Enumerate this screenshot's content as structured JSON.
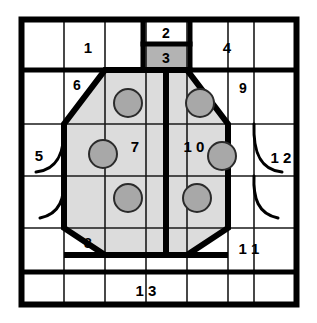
{
  "diagram": {
    "colors": {
      "line": "#000000",
      "background": "#ffffff",
      "octagon_fill": "#d9d9d9",
      "shaded_cell_fill": "#b3b3b3",
      "circle_fill": "#a6a6a6",
      "circle_stroke": "#333333",
      "thin_line": "#1a1a1a"
    },
    "geometry": {
      "outer_border": {
        "x": 20,
        "y": 18,
        "width": 278,
        "height": 288,
        "stroke_width": 6
      },
      "columns_x": [
        20,
        64,
        105,
        146,
        187,
        228,
        258,
        298
      ],
      "rows_y": [
        18,
        70,
        124,
        176,
        228,
        272,
        306
      ],
      "center_divider_x": 166,
      "octagon_points": "105,70 187,70 228,124 228,228 187,255 105,255 64,228 64,124",
      "thick_stroke": 6,
      "thin_stroke": 1.6
    },
    "circles": [
      {
        "name": "circle-top-left",
        "cx": 128,
        "cy": 103,
        "r": 14
      },
      {
        "name": "circle-top-right",
        "cx": 200,
        "cy": 103,
        "r": 14
      },
      {
        "name": "circle-mid-left",
        "cx": 103,
        "cy": 154,
        "r": 14
      },
      {
        "name": "circle-mid-right",
        "cx": 222,
        "cy": 156,
        "r": 14
      },
      {
        "name": "circle-bottom-left",
        "cx": 128,
        "cy": 198,
        "r": 14
      },
      {
        "name": "circle-bottom-right",
        "cx": 197,
        "cy": 198,
        "r": 14
      }
    ],
    "arcs": [
      {
        "name": "arc-left-upper",
        "d": "M 38 170 C 60 168 66 150 64 124",
        "side": "left"
      },
      {
        "name": "arc-left-lower",
        "d": "M 44 215 C 62 212 66 196 64 176",
        "side": "left"
      },
      {
        "name": "arc-right-upper",
        "d": "M 280 170 C 258 168 252 150 254 124",
        "side": "right"
      },
      {
        "name": "arc-right-lower",
        "d": "M 274 215 C 256 212 252 196 254 176",
        "side": "right"
      }
    ],
    "shaded_cells": [
      {
        "name": "shaded-cell-3",
        "x": 146,
        "y": 44,
        "width": 41,
        "height": 26
      }
    ],
    "labels": [
      {
        "id": "label-1",
        "text": "1",
        "x": 88,
        "y": 47
      },
      {
        "id": "label-2",
        "text": "2",
        "x": 166,
        "y": 34
      },
      {
        "id": "label-3",
        "text": "3",
        "x": 166,
        "y": 58
      },
      {
        "id": "label-4",
        "text": "4",
        "x": 227,
        "y": 47
      },
      {
        "id": "label-5",
        "text": "5",
        "x": 39,
        "y": 155
      },
      {
        "id": "label-6",
        "text": "6",
        "x": 76,
        "y": 84
      },
      {
        "id": "label-7",
        "text": "7",
        "x": 135,
        "y": 146
      },
      {
        "id": "label-8",
        "text": "8",
        "x": 87,
        "y": 243
      },
      {
        "id": "label-9",
        "text": "9",
        "x": 244,
        "y": 88
      },
      {
        "id": "label-10",
        "text": "1 0",
        "x": 193,
        "y": 146
      },
      {
        "id": "label-11",
        "text": "1 1",
        "x": 250,
        "y": 248
      },
      {
        "id": "label-12",
        "text": "1 2",
        "x": 282,
        "y": 157
      },
      {
        "id": "label-13",
        "text": "1 3",
        "x": 145,
        "y": 290
      }
    ]
  }
}
